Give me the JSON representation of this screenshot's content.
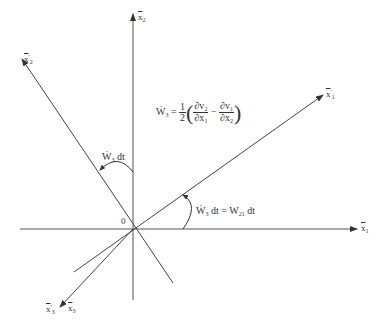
{
  "diagram": {
    "type": "coordinate-rotation",
    "origin_label": "0",
    "axes": {
      "x1": {
        "base": "x",
        "sub": "1",
        "prime": ""
      },
      "x2": {
        "base": "x",
        "sub": "2",
        "prime": ""
      },
      "x3": {
        "base": "x",
        "sub": "3",
        "prime": ""
      },
      "x1p": {
        "base": "x",
        "sub": "1",
        "prime": "′"
      },
      "x2p": {
        "base": "x",
        "sub": "2",
        "prime": "′"
      },
      "x3p": {
        "base": "x",
        "sub": "3",
        "prime": "′"
      }
    },
    "equation": {
      "lhs_base": "Ẇ",
      "lhs_sub": "3",
      "eq": "=",
      "half_num": "1",
      "half_den": "2",
      "t1_num_base": "∂v",
      "t1_num_sub": "2",
      "t1_den_base": "∂x",
      "t1_den_sub": "1",
      "minus": "−",
      "t2_num_base": "∂v",
      "t2_num_sub": "1",
      "t2_den_base": "∂x",
      "t2_den_sub": "2"
    },
    "angle_label_upper": {
      "base": "Ẇ",
      "sub": "3",
      "rest": " dt"
    },
    "angle_label_lower": {
      "base": "Ẇ",
      "sub": "3",
      "rest": " dt = W",
      "sub2": "21",
      "rest2": " dt"
    },
    "colors": {
      "line": "#444444",
      "text": "#333333",
      "background": "#ffffff"
    }
  }
}
